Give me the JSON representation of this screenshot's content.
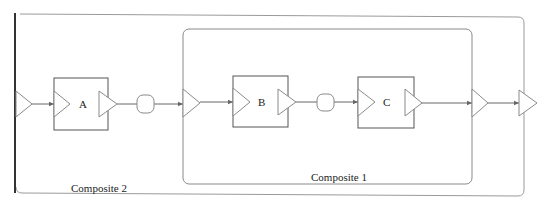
{
  "diagram": {
    "type": "actor-dataflow-composite",
    "composites": [
      {
        "id": "composite2",
        "label": "Composite 2",
        "contains": [
          "A",
          "composite1"
        ]
      },
      {
        "id": "composite1",
        "label": "Composite 1",
        "contains": [
          "B",
          "C"
        ]
      }
    ],
    "blocks": [
      {
        "id": "A",
        "label": "A"
      },
      {
        "id": "B",
        "label": "B"
      },
      {
        "id": "C",
        "label": "C"
      }
    ],
    "relations": [
      {
        "id": "r1",
        "between": [
          "A.out",
          "composite1.in"
        ]
      },
      {
        "id": "r2",
        "between": [
          "B.out",
          "C.in"
        ]
      }
    ],
    "connections": [
      [
        "composite2.in",
        "A.in"
      ],
      [
        "A.out",
        "r1"
      ],
      [
        "r1",
        "composite1.in"
      ],
      [
        "composite1.in",
        "B.in"
      ],
      [
        "B.out",
        "r2"
      ],
      [
        "r2",
        "C.in"
      ],
      [
        "C.out",
        "composite1.out"
      ],
      [
        "composite1.out",
        "composite2.out"
      ]
    ],
    "colors": {
      "frame": "#9a9a9a",
      "block": "#555555",
      "port": "#8a8a8a",
      "link": "#666666",
      "edge_bar": "#333333"
    }
  }
}
